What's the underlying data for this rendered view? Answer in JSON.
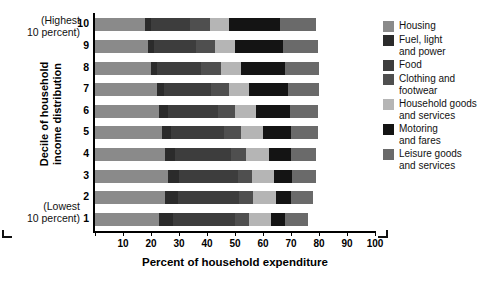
{
  "chart_data": {
    "type": "bar",
    "orientation": "horizontal",
    "stacked": true,
    "title": "",
    "xlabel": "Percent of household expenditure",
    "ylabel": "Decile of household\nincome distribution",
    "xlim": [
      0,
      100
    ],
    "xticks": [
      0,
      10,
      20,
      30,
      40,
      50,
      60,
      70,
      80,
      90,
      100
    ],
    "xticklabels": [
      "",
      "10",
      "20",
      "30",
      "40",
      "50",
      "60",
      "70",
      "80",
      "90",
      "100"
    ],
    "grid": false,
    "legend_position": "right",
    "categories": [
      "10",
      "9",
      "8",
      "7",
      "6",
      "5",
      "4",
      "3",
      "2",
      "1"
    ],
    "annotations": {
      "top": "(Highest\n10 percent)",
      "bottom": "(Lowest\n10 percent)"
    },
    "series": [
      {
        "name": "Housing",
        "color": "#8a8a8a",
        "values": [
          18.0,
          19.0,
          20.0,
          22.0,
          23.0,
          24.0,
          25.0,
          26.0,
          25.0,
          23.0
        ]
      },
      {
        "name": "Fuel, light\nand power",
        "color": "#2b2b2b",
        "values": [
          2.0,
          2.0,
          2.0,
          2.5,
          3.0,
          3.0,
          3.5,
          4.0,
          4.5,
          5.0
        ]
      },
      {
        "name": "Food",
        "color": "#3d3d3d",
        "values": [
          14.0,
          15.0,
          16.0,
          17.0,
          18.0,
          19.0,
          20.0,
          21.0,
          22.0,
          22.0
        ]
      },
      {
        "name": "Clothing and\nfootwear",
        "color": "#4f4f4f",
        "values": [
          7.0,
          7.0,
          7.0,
          6.5,
          6.0,
          6.0,
          5.5,
          5.0,
          5.0,
          5.0
        ]
      },
      {
        "name": "Household goods\nand services",
        "color": "#b5b5b5",
        "values": [
          7.0,
          7.0,
          7.0,
          7.0,
          7.5,
          8.0,
          8.0,
          8.0,
          8.0,
          8.0
        ]
      },
      {
        "name": "Motoring\nand fares",
        "color": "#141414",
        "values": [
          18.0,
          17.0,
          16.0,
          14.0,
          12.0,
          10.0,
          8.0,
          6.5,
          5.5,
          5.0
        ]
      },
      {
        "name": "Leisure goods\nand services",
        "color": "#6a6a6a",
        "values": [
          13.0,
          12.5,
          12.0,
          11.0,
          10.0,
          9.5,
          9.0,
          8.5,
          8.0,
          8.0
        ]
      }
    ]
  }
}
